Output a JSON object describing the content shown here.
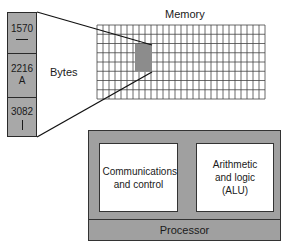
{
  "memory": {
    "title": "Memory",
    "grid": {
      "x": 97,
      "y": 25,
      "cols": 28,
      "rows": 8,
      "cell_w": 6,
      "cell_h": 9.25
    },
    "highlight": {
      "x": 135,
      "y": 44,
      "w": 17,
      "h": 28,
      "color": "#8c8c8c"
    }
  },
  "bytes": {
    "label": "Bytes",
    "cells": [
      {
        "address": "1570",
        "value": "—",
        "glyph": "dash"
      },
      {
        "address": "2216",
        "value": "A",
        "glyph": "text"
      },
      {
        "address": "3082",
        "value": "|",
        "glyph": "bar"
      }
    ]
  },
  "processor": {
    "label": "Processor",
    "units": [
      {
        "label": "Communications and control"
      },
      {
        "label": "Arithmetic and logic (ALU)"
      }
    ]
  },
  "colors": {
    "fill_gray": "#a8a8a8",
    "line": "#2a2a2a",
    "background": "#ffffff"
  }
}
